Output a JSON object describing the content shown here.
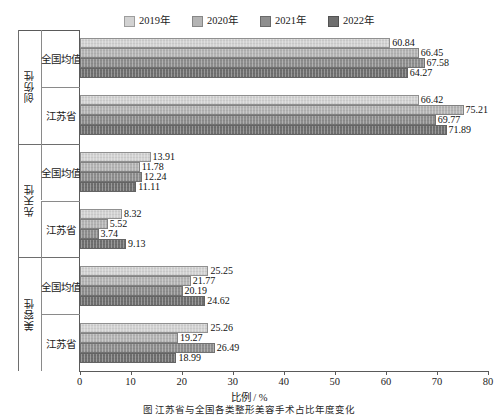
{
  "chart_data": {
    "type": "bar",
    "orientation": "horizontal",
    "title": "",
    "xlabel": "比例 / %",
    "ylabel": "",
    "xlim": [
      0,
      80
    ],
    "xticks": [
      0,
      10,
      20,
      30,
      40,
      50,
      60,
      70,
      80
    ],
    "grid": false,
    "legend_position": "top-center",
    "legend": [
      "2019年",
      "2020年",
      "2021年",
      "2022年"
    ],
    "series_colors": [
      "#d2d2d2",
      "#b4b4b4",
      "#8e8e8e",
      "#6f6f6f"
    ],
    "groups": [
      {
        "group_label": "创伤性",
        "categories": [
          {
            "label": "全国均值",
            "values": [
              60.84,
              66.45,
              67.58,
              64.27
            ]
          },
          {
            "label": "江苏省",
            "values": [
              66.42,
              75.21,
              69.77,
              71.89
            ]
          }
        ]
      },
      {
        "group_label": "先天性",
        "categories": [
          {
            "label": "全国均值",
            "values": [
              13.91,
              11.78,
              12.24,
              11.11
            ]
          },
          {
            "label": "江苏省",
            "values": [
              8.32,
              5.52,
              3.74,
              9.13
            ]
          }
        ]
      },
      {
        "group_label": "美容性",
        "categories": [
          {
            "label": "全国均值",
            "values": [
              25.25,
              21.77,
              20.19,
              24.62
            ]
          },
          {
            "label": "江苏省",
            "values": [
              25.26,
              19.27,
              26.49,
              18.99
            ]
          }
        ]
      }
    ]
  },
  "caption": {
    "text": "图 江苏省与全国各类整形美容手术占比年度变化"
  }
}
